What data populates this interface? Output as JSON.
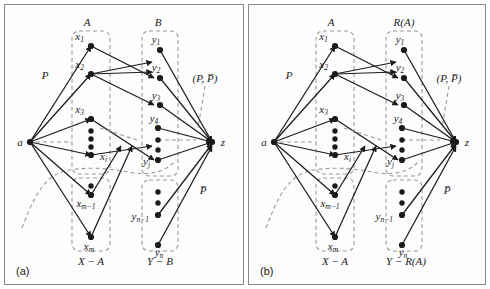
{
  "figure": {
    "panels": [
      {
        "id": "a",
        "caption": "(a)",
        "sets": {
          "top_left_label": "A",
          "top_right_label": "B",
          "bottom_left_label": "X − A",
          "bottom_right_label": "Y − B"
        },
        "source_node": "a",
        "sink_node": "z",
        "cut_label": "(P, P̅)",
        "p_label": "P",
        "pbar_label": "P̅",
        "left_nodes_top": [
          "x₁",
          "x₂",
          "x₃",
          "xᵢ"
        ],
        "left_nodes_bottom": [
          "xₘ₋₁",
          "xₘ"
        ],
        "right_nodes_top": [
          "y₁",
          "y₂",
          "y₃",
          "y₄",
          "yⱼ"
        ],
        "right_nodes_bottom": [
          "yₙ₋₁",
          "yₙ"
        ]
      },
      {
        "id": "b",
        "caption": "(b)",
        "sets": {
          "top_left_label": "A",
          "top_right_label": "R(A)",
          "bottom_left_label": "X − A",
          "bottom_right_label": "Y − R(A)"
        },
        "source_node": "a",
        "sink_node": "z",
        "cut_label": "(P, P̅)",
        "p_label": "P",
        "pbar_label": "P̅",
        "left_nodes_top": [
          "x₁",
          "x₂",
          "x₃",
          "xᵢ"
        ],
        "left_nodes_bottom": [
          "xₘ₋₁",
          "xₘ"
        ],
        "right_nodes_top": [
          "y₁",
          "y₂",
          "y₃",
          "y₄",
          "yⱼ"
        ],
        "right_nodes_bottom": [
          "yₙ₋₁",
          "yₙ"
        ]
      }
    ],
    "node_glyphs": {
      "source": "a",
      "sink": "z",
      "x_base": "x",
      "y_base": "y"
    },
    "subscripts": {
      "one": "1",
      "two": "2",
      "three": "3",
      "four": "4",
      "i": "i",
      "j": "j",
      "m_minus_1": "m−1",
      "m": "m",
      "n_minus_1": "n−1",
      "n": "n"
    },
    "colors": {
      "ink": "#1b1b1b",
      "frame": "#8a8a8a",
      "dashed": "#9a9a9a",
      "background": "#ffffff",
      "panel_background": "#fdfdfd"
    }
  }
}
